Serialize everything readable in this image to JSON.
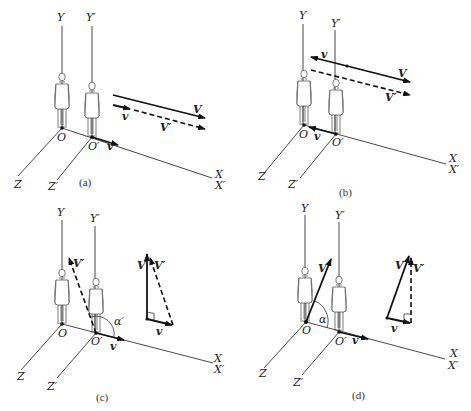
{
  "colors": {
    "ink": "#111111",
    "background": "#ffffff"
  },
  "panels": [
    {
      "id": "a",
      "caption": "(a)",
      "labels": {
        "Y": "Y",
        "Yp": "Y′",
        "O": "O",
        "Op": "O′",
        "X": "X",
        "Xp": "X′",
        "Z": "Z",
        "Zp": "Z′",
        "v_axis": "v",
        "V": "V",
        "Vp": "V′",
        "v_vec": "v"
      },
      "description": "Frames at origin aligned; V and V′ parallel along +X; v along +X"
    },
    {
      "id": "b",
      "caption": "(b)",
      "labels": {
        "Y": "Y",
        "Yp": "Y′",
        "O": "O",
        "Op": "O′",
        "X": "X",
        "Xp": "X′",
        "Z": "Z",
        "Zp": "Z′",
        "v_axis": "v",
        "V": "V",
        "Vp": "V′",
        "v_vec": "v"
      },
      "description": "v points toward −X (from O′ to O); V along +X with v opposing; V′ dashed"
    },
    {
      "id": "c",
      "caption": "(c)",
      "labels": {
        "Y": "Y",
        "Yp": "Y′",
        "O": "O",
        "Op": "O′",
        "X": "X",
        "Xp": "X′",
        "Z": "Z",
        "Zp": "Z′",
        "v_axis": "v",
        "Vp_vec": "V′",
        "angle": "α′",
        "tri_V": "V",
        "tri_Vp": "V′",
        "tri_v": "v"
      },
      "description": "V′ dashed from O′ at angle α′; vector triangle with V vertical, v horizontal, V′ hypotenuse"
    },
    {
      "id": "d",
      "caption": "(d)",
      "labels": {
        "Y": "Y",
        "Yp": "Y′",
        "O": "O",
        "Op": "O′",
        "X": "X",
        "Xp": "X′",
        "Z": "Z",
        "Zp": "Z′",
        "v_axis": "v",
        "V_vec": "V",
        "angle": "α",
        "tri_V": "V",
        "tri_Vp": "V′",
        "tri_v": "v"
      },
      "description": "V solid from O at angle α; vector triangle with V′ vertical dashed, v horizontal, V hypotenuse"
    }
  ]
}
